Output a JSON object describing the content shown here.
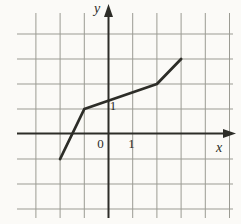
{
  "colors": {
    "background": "#fbfaf7",
    "grid": "#9b9b93",
    "axis": "#2d2d28",
    "curve": "#2d2d28"
  },
  "chart_data": {
    "type": "line",
    "title": "",
    "xlabel": "x",
    "ylabel": "y",
    "origin_label": "0",
    "points": [
      [
        -2,
        -1
      ],
      [
        -1,
        1
      ],
      [
        2,
        2
      ],
      [
        3,
        3
      ]
    ],
    "x_tick_labels": [
      {
        "value": 1,
        "label": "1"
      }
    ],
    "y_tick_labels": [
      {
        "value": 1,
        "label": "1"
      }
    ],
    "grid": true,
    "grid_x_range": [
      -3,
      5
    ],
    "grid_y_range": [
      -3,
      4
    ],
    "xlim": [
      -3.8,
      5.2
    ],
    "ylim": [
      -3.4,
      5.2
    ]
  }
}
